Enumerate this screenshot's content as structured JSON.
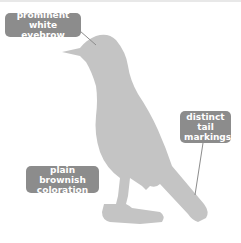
{
  "diagram": {
    "colors": {
      "silhouette": "#c4c4c4",
      "label_bg": "#8c8c8c",
      "label_text": "#ffffff",
      "leader_line": "#8c8c8c"
    },
    "labels": [
      {
        "line1": "prominent",
        "line2": "white eyebrow"
      },
      {
        "line1": "distinct tail",
        "line2": "markings"
      },
      {
        "line1": "plain brownish",
        "line2": "coloration"
      }
    ]
  }
}
